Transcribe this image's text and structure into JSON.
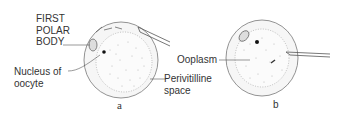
{
  "figure": {
    "panel_a": {
      "caption": "a",
      "labels": {
        "first_polar_body": [
          "FIRST",
          "POLAR",
          "BODY"
        ],
        "nucleus": [
          "Nucleus of",
          "oocyte"
        ],
        "perivitelline": [
          "Perivitilline",
          "space"
        ]
      }
    },
    "panel_b": {
      "caption": "b",
      "labels": {
        "ooplasm": "Ooplasm"
      }
    }
  }
}
